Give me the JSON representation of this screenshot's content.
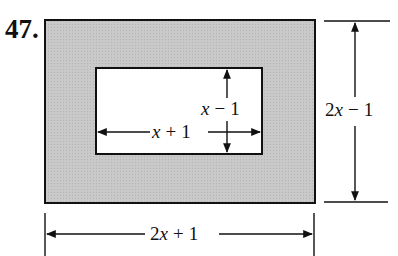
{
  "problem_number": "47.",
  "figure": {
    "outer_rect": {
      "fill": "#c8c8c8",
      "stroke": "#111111"
    },
    "inner_rect": {
      "fill": "#ffffff",
      "stroke": "#111111"
    },
    "labels": {
      "outer_height": {
        "var": "2x",
        "op": "−",
        "const": "1"
      },
      "outer_width": {
        "var": "2x",
        "op": "+",
        "const": "1"
      },
      "inner_height": {
        "var": "x",
        "op": "−",
        "const": "1"
      },
      "inner_width": {
        "var": "x",
        "op": "+",
        "const": "1"
      }
    }
  }
}
